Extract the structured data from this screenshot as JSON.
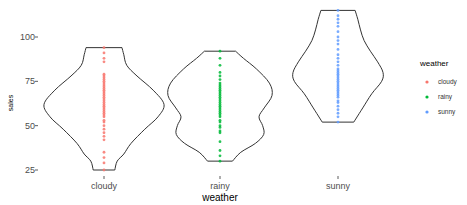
{
  "chart_data": {
    "type": "violin",
    "title": "",
    "xlabel": "weather",
    "ylabel": "sales",
    "ylim": [
      22,
      118
    ],
    "yticks": [
      25,
      50,
      75,
      100
    ],
    "categories": [
      "cloudy",
      "rainy",
      "sunny"
    ],
    "grid": false,
    "legend": {
      "title": "weather",
      "position": "right",
      "entries": [
        {
          "label": "cloudy",
          "color": "#F8766D"
        },
        {
          "label": "rainy",
          "color": "#00BA38"
        },
        {
          "label": "sunny",
          "color": "#619CFF"
        }
      ]
    },
    "series": [
      {
        "name": "cloudy",
        "color": "#F8766D",
        "range": [
          25,
          94
        ],
        "density_profile": [
          [
            94,
            0.3
          ],
          [
            90,
            0.33
          ],
          [
            84,
            0.38
          ],
          [
            78,
            0.55
          ],
          [
            70,
            0.82
          ],
          [
            62,
            1.0
          ],
          [
            55,
            0.9
          ],
          [
            48,
            0.68
          ],
          [
            40,
            0.45
          ],
          [
            34,
            0.33
          ],
          [
            30,
            0.22
          ],
          [
            25,
            0.18
          ]
        ],
        "points": [
          25,
          29,
          32,
          35,
          42,
          44,
          46,
          48,
          50,
          52,
          53,
          55,
          56,
          57,
          58,
          59,
          60,
          61,
          62,
          63,
          64,
          65,
          66,
          67,
          68,
          69,
          70,
          71,
          72,
          73,
          74,
          75,
          76,
          77,
          78,
          79,
          86,
          88,
          91,
          94
        ]
      },
      {
        "name": "rainy",
        "color": "#00BA38",
        "range": [
          30,
          92
        ],
        "density_profile": [
          [
            92,
            0.3
          ],
          [
            88,
            0.45
          ],
          [
            82,
            0.7
          ],
          [
            74,
            0.95
          ],
          [
            67,
            1.0
          ],
          [
            60,
            0.85
          ],
          [
            55,
            0.75
          ],
          [
            50,
            0.82
          ],
          [
            45,
            0.84
          ],
          [
            40,
            0.68
          ],
          [
            35,
            0.4
          ],
          [
            30,
            0.24
          ]
        ],
        "points": [
          30,
          33,
          36,
          41,
          46,
          47,
          49,
          50,
          52,
          53,
          55,
          56,
          57,
          58,
          59,
          60,
          61,
          62,
          63,
          64,
          65,
          66,
          67,
          68,
          69,
          70,
          71,
          72,
          73,
          74,
          76,
          78,
          80,
          84,
          88,
          92
        ]
      },
      {
        "name": "sunny",
        "color": "#619CFF",
        "range": [
          52,
          115
        ],
        "density_profile": [
          [
            115,
            0.38
          ],
          [
            110,
            0.44
          ],
          [
            104,
            0.5
          ],
          [
            98,
            0.58
          ],
          [
            92,
            0.72
          ],
          [
            86,
            0.88
          ],
          [
            80,
            1.0
          ],
          [
            75,
            0.97
          ],
          [
            68,
            0.75
          ],
          [
            60,
            0.55
          ],
          [
            56,
            0.45
          ],
          [
            52,
            0.35
          ]
        ],
        "points": [
          52,
          55,
          57,
          59,
          61,
          63,
          64,
          66,
          67,
          68,
          69,
          70,
          71,
          72,
          73,
          74,
          75,
          76,
          77,
          78,
          79,
          80,
          81,
          82,
          84,
          86,
          88,
          90,
          93,
          96,
          98,
          100,
          103,
          106,
          108,
          110,
          112,
          115
        ]
      }
    ]
  }
}
